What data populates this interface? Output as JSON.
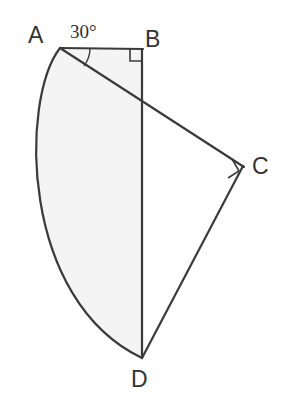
{
  "figure": {
    "name": "circular-sector-with-right-triangles",
    "background_color": "#ffffff",
    "stroke_color": "#3a3a3a",
    "shade_color": "#f4f4f4",
    "stroke_width": 2,
    "labels": {
      "a": "A",
      "b": "B",
      "c": "C",
      "d": "D",
      "angle": "30°"
    },
    "points": {
      "A": {
        "x": 60,
        "y": 48
      },
      "B": {
        "x": 142,
        "y": 49
      },
      "C": {
        "x": 243,
        "y": 166
      },
      "D": {
        "x": 142,
        "y": 358
      }
    },
    "arc": {
      "from": "A",
      "to": "D",
      "bulge_x": 29,
      "bulge_y": 203
    },
    "segments": [
      {
        "name": "segment-AB",
        "from": "A",
        "to": "B"
      },
      {
        "name": "segment-BD",
        "from": "B",
        "to": "D"
      },
      {
        "name": "segment-AC",
        "from": "A",
        "to": "C"
      },
      {
        "name": "segment-CD",
        "from": "C",
        "to": "D"
      }
    ],
    "right_angle_marks": [
      {
        "name": "right-angle-mark-B",
        "at": "B"
      },
      {
        "name": "right-angle-mark-C",
        "at": "C"
      }
    ],
    "angle_marks": [
      {
        "name": "angle-arc-A",
        "at": "A",
        "value": "30°"
      }
    ],
    "shaded_region": {
      "name": "shaded-sector-region",
      "bounded_by": [
        "arc-A-D",
        "segment-D-B",
        "segment-B-A"
      ]
    }
  }
}
